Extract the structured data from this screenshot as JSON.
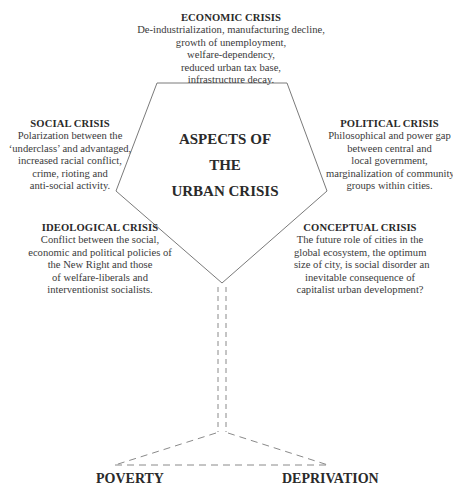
{
  "diagram": {
    "center_title": [
      "ASPECTS OF",
      "THE",
      "URBAN CRISIS"
    ],
    "aspects": {
      "economic": {
        "heading": "ECONOMIC CRISIS",
        "lines": [
          "De-industrialization, manufacturing decline,",
          "growth of unemployment,",
          "welfare-dependency,",
          "reduced urban tax base,",
          "infrastructure decay."
        ]
      },
      "social": {
        "heading": "SOCIAL CRISIS",
        "lines": [
          "Polarization between the",
          "‘underclass’ and advantaged,",
          "increased racial conflict,",
          "crime, rioting and",
          "anti-social activity."
        ]
      },
      "political": {
        "heading": "POLITICAL CRISIS",
        "lines": [
          "Philosophical and power gap",
          "between central and",
          "local government,",
          "marginalization of community",
          "groups within cities."
        ]
      },
      "ideological": {
        "heading": "IDEOLOGICAL CRISIS",
        "lines": [
          "Conflict between the social,",
          "economic and political policies of",
          "the New Right and those",
          "of welfare-liberals and",
          "interventionist socialists."
        ]
      },
      "conceptual": {
        "heading": "CONCEPTUAL CRISIS",
        "lines": [
          "The future role of cities in the",
          "global ecosystem, the optimum",
          "size of city, is social disorder an",
          "inevitable consequence of",
          "capitalist urban development?"
        ]
      }
    },
    "base_labels": {
      "left": "POVERTY",
      "right": "DEPRIVATION"
    },
    "colors": {
      "line": "#7a7a7a",
      "text": "#2a2a2a",
      "background": "#ffffff"
    }
  }
}
